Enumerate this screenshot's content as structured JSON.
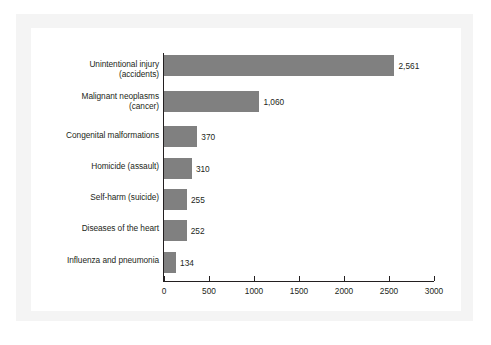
{
  "chart_data": {
    "type": "bar",
    "orientation": "horizontal",
    "title": "",
    "subtitle": "",
    "xlabel": "",
    "ylabel": "",
    "grid": false,
    "legend": null,
    "xlim": [
      0,
      3000
    ],
    "xticks": [
      0,
      500,
      1000,
      1500,
      2000,
      2500,
      3000
    ],
    "xtick_labels": [
      "0",
      "500",
      "1000",
      "1500",
      "2000",
      "2500",
      "3000"
    ],
    "bar_color": "#808080",
    "axis_color": "#231f20",
    "text_color": "#231f20",
    "categories": [
      "Unintentional injury (accidents)",
      "Malignant neoplasms (cancer)",
      "Congenital malformations",
      "Homicide (assault)",
      "Self-harm (suicide)",
      "Diseases of the heart",
      "Influenza and pneumonia"
    ],
    "values": [
      2561,
      1060,
      370,
      310,
      255,
      252,
      134
    ],
    "value_labels": [
      "2,561",
      "1,060",
      "370",
      "310",
      "255",
      "252",
      "134"
    ],
    "category_label_lines": [
      [
        "Unintentional injury",
        "(accidents)"
      ],
      [
        "Malignant neoplasms",
        "(cancer)"
      ],
      [
        "Congenital malformations"
      ],
      [
        "Homicide (assault)"
      ],
      [
        "Self-harm (suicide)"
      ],
      [
        "Diseases of the heart"
      ],
      [
        "Influenza and pneumonia"
      ]
    ]
  }
}
